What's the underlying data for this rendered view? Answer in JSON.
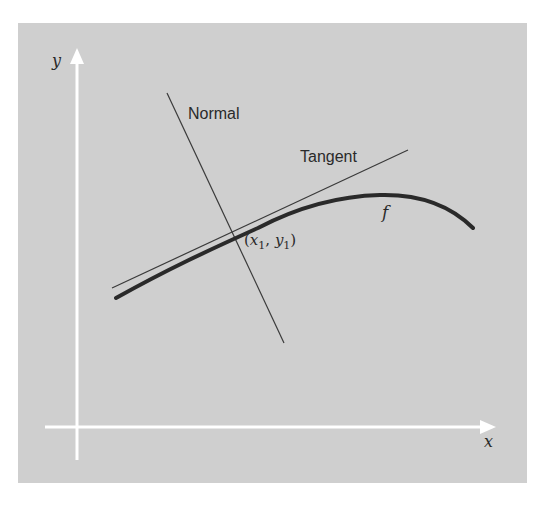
{
  "figure": {
    "panel_color": "#cfcfcf",
    "axis_color": "#ffffff",
    "line_color": "#2a2a2a",
    "axes": {
      "x_label": "x",
      "y_label": "y"
    },
    "labels": {
      "normal": "Normal",
      "tangent": "Tangent",
      "function": "f",
      "point": "(x1, y1)",
      "point_x": "x",
      "point_x_sub": "1",
      "point_y": "y",
      "point_y_sub": "1"
    }
  }
}
